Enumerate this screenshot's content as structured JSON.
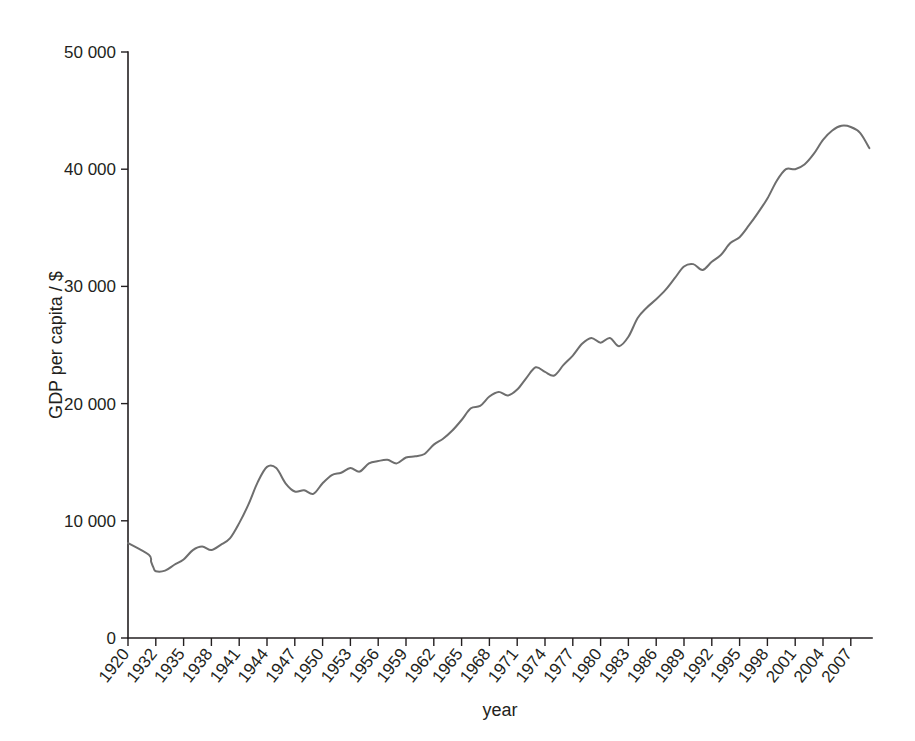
{
  "chart_data": {
    "type": "line",
    "title": "",
    "subtitle": "",
    "xlabel": "year",
    "ylabel": "GDP per capita / $",
    "xlim": [
      1920,
      2009
    ],
    "ylim": [
      0,
      50000
    ],
    "grid": false,
    "legend": null,
    "series_color": "#6e6e6e",
    "axis_color": "#231f20",
    "y_ticks": [
      0,
      10000,
      20000,
      30000,
      40000,
      50000
    ],
    "y_tick_labels": [
      "0",
      "10 000",
      "20 000",
      "30 000",
      "40 000",
      "50 000"
    ],
    "x_ticks": [
      1920,
      1932,
      1935,
      1938,
      1941,
      1944,
      1947,
      1950,
      1953,
      1956,
      1959,
      1962,
      1965,
      1968,
      1971,
      1974,
      1977,
      1980,
      1983,
      1986,
      1989,
      1992,
      1995,
      1998,
      2001,
      2004,
      2007
    ],
    "x_tick_labels": [
      "1920",
      "1932",
      "1935",
      "1938",
      "1941",
      "1944",
      "1947",
      "1950",
      "1953",
      "1956",
      "1959",
      "1962",
      "1965",
      "1968",
      "1971",
      "1974",
      "1977",
      "1980",
      "1983",
      "1986",
      "1989",
      "1992",
      "1995",
      "1998",
      "2001",
      "2004",
      "2007"
    ],
    "series": [
      {
        "name": "GDP per capita",
        "x": [
          1920,
          1929,
          1930,
          1931,
          1932,
          1933,
          1934,
          1935,
          1936,
          1937,
          1938,
          1939,
          1940,
          1941,
          1942,
          1943,
          1944,
          1945,
          1946,
          1947,
          1948,
          1949,
          1950,
          1951,
          1952,
          1953,
          1954,
          1955,
          1956,
          1957,
          1958,
          1959,
          1960,
          1961,
          1962,
          1963,
          1964,
          1965,
          1966,
          1967,
          1968,
          1969,
          1970,
          1971,
          1972,
          1973,
          1974,
          1975,
          1976,
          1977,
          1978,
          1979,
          1980,
          1981,
          1982,
          1983,
          1984,
          1985,
          1986,
          1987,
          1988,
          1989,
          1990,
          1991,
          1992,
          1993,
          1994,
          1995,
          1996,
          1997,
          1998,
          1999,
          2000,
          2001,
          2002,
          2003,
          2004,
          2005,
          2006,
          2007,
          2008,
          2009
        ],
        "y": [
          8100,
          7100,
          6500,
          6000,
          5700,
          5750,
          6250,
          6700,
          7500,
          7800,
          7500,
          7950,
          8500,
          9800,
          11400,
          13300,
          14600,
          14500,
          13200,
          12500,
          12600,
          12300,
          13200,
          13900,
          14100,
          14500,
          14200,
          14900,
          15100,
          15200,
          14900,
          15400,
          15500,
          15700,
          16500,
          17000,
          17700,
          18600,
          19600,
          19800,
          20600,
          21000,
          20700,
          21200,
          22200,
          23100,
          22700,
          22400,
          23300,
          24100,
          25100,
          25600,
          25200,
          25600,
          24900,
          25700,
          27300,
          28200,
          28900,
          29700,
          30700,
          31700,
          31900,
          31400,
          32100,
          32700,
          33700,
          34200,
          35200,
          36300,
          37500,
          39000,
          40000,
          40000,
          40400,
          41300,
          42500,
          43300,
          43700,
          43600,
          43100,
          41800
        ]
      }
    ]
  },
  "axes": {
    "y_axis_label": "GDP per capita / $",
    "x_axis_label": "year"
  }
}
